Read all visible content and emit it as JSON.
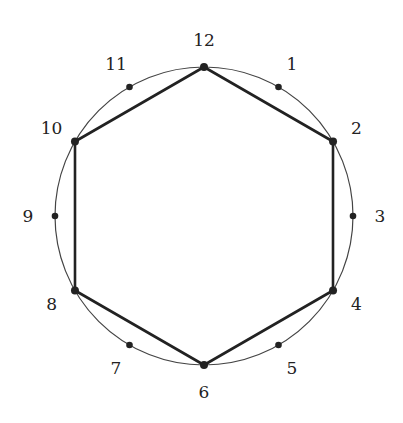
{
  "diagram": {
    "type": "clock-face-hexagon",
    "positions": [
      "12",
      "1",
      "2",
      "3",
      "4",
      "5",
      "6",
      "7",
      "8",
      "9",
      "10",
      "11"
    ],
    "hexagon_vertices": [
      "12",
      "2",
      "4",
      "6",
      "8",
      "10"
    ],
    "colors": {
      "stroke": "#222222",
      "circle": "#444444",
      "text": "#222222"
    }
  }
}
